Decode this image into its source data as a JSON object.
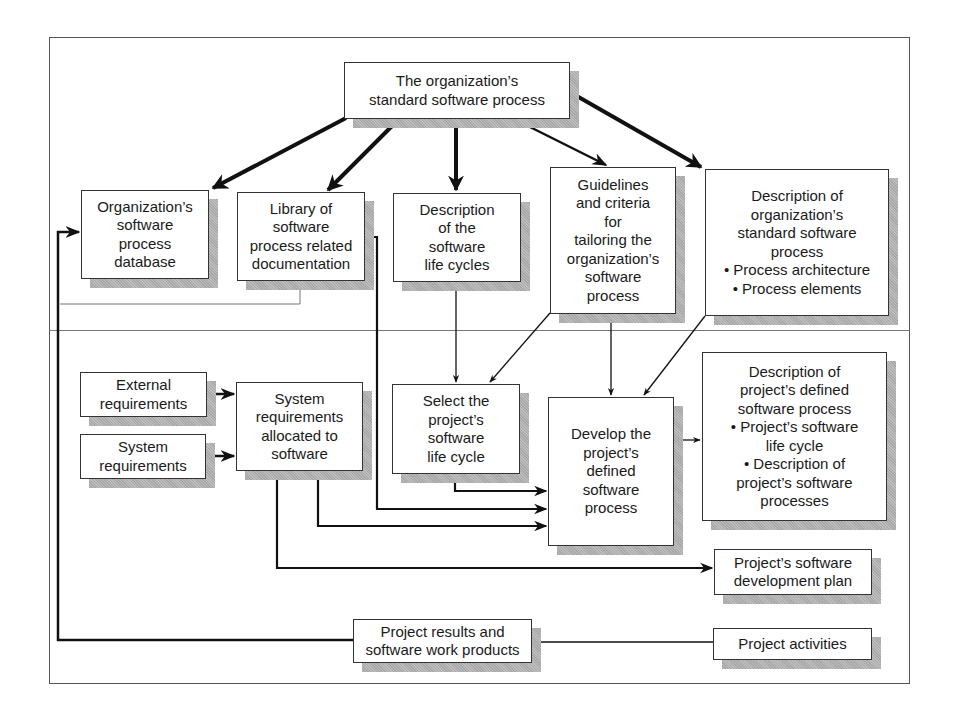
{
  "diagram": {
    "nodes": [
      {
        "id": "org_std_process",
        "label": "The organization’s\nstandard software process",
        "x": 344,
        "y": 62,
        "w": 226,
        "h": 57
      },
      {
        "id": "org_process_db",
        "label": "Organization’s\nsoftware\nprocess\ndatabase",
        "x": 81,
        "y": 190,
        "w": 128,
        "h": 89
      },
      {
        "id": "library_docs",
        "label": "Library of\nsoftware\nprocess related\ndocumentation",
        "x": 237,
        "y": 192,
        "w": 128,
        "h": 89
      },
      {
        "id": "desc_life_cycles",
        "label": "Description\nof the\nsoftware\nlife cycles",
        "x": 393,
        "y": 193,
        "w": 128,
        "h": 89
      },
      {
        "id": "tailoring_guidelines",
        "label": "Guidelines\nand criteria\nfor\ntailoring the\norganization’s\nsoftware\nprocess",
        "x": 550,
        "y": 167,
        "w": 126,
        "h": 147
      },
      {
        "id": "desc_org_std_process",
        "label": "Description of\norganization’s\nstandard software\nprocess\n• Process architecture\n• Process elements",
        "x": 705,
        "y": 169,
        "w": 184,
        "h": 147
      },
      {
        "id": "external_reqs",
        "label": "External\nrequirements",
        "x": 80,
        "y": 372,
        "w": 127,
        "h": 45
      },
      {
        "id": "system_reqs",
        "label": "System\nrequirements",
        "x": 80,
        "y": 434,
        "w": 126,
        "h": 45
      },
      {
        "id": "sys_reqs_alloc",
        "label": "System\nrequirements\nallocated to\nsoftware",
        "x": 236,
        "y": 382,
        "w": 127,
        "h": 89
      },
      {
        "id": "select_life_cycle",
        "label": "Select the\nproject’s\nsoftware\nlife cycle",
        "x": 392,
        "y": 384,
        "w": 128,
        "h": 90
      },
      {
        "id": "develop_defined_process",
        "label": "Develop the\nproject’s\ndefined\nsoftware\nprocess",
        "x": 548,
        "y": 397,
        "w": 126,
        "h": 149
      },
      {
        "id": "desc_project_process",
        "label": "Description of\nproject’s defined\nsoftware process\n• Project’s software\nlife cycle\n• Description of\nproject’s software\nprocesses",
        "x": 702,
        "y": 352,
        "w": 185,
        "h": 169
      },
      {
        "id": "dev_plan",
        "label": "Project’s software\ndevelopment plan",
        "x": 714,
        "y": 549,
        "w": 158,
        "h": 46
      },
      {
        "id": "results_products",
        "label": "Project results and\nsoftware work products",
        "x": 353,
        "y": 619,
        "w": 179,
        "h": 44
      },
      {
        "id": "project_activities",
        "label": "Project activities",
        "x": 713,
        "y": 628,
        "w": 159,
        "h": 32
      }
    ],
    "edges": [
      {
        "from": "org_std_process",
        "to": "org_process_db",
        "weight": "heavy"
      },
      {
        "from": "org_std_process",
        "to": "library_docs",
        "weight": "heavy"
      },
      {
        "from": "org_std_process",
        "to": "desc_life_cycles",
        "weight": "heavy"
      },
      {
        "from": "org_std_process",
        "to": "tailoring_guidelines",
        "weight": "medium"
      },
      {
        "from": "org_std_process",
        "to": "desc_org_std_process",
        "weight": "heavy"
      },
      {
        "from": "org_process_db",
        "to": "library_docs",
        "weight": "light"
      },
      {
        "from": "desc_life_cycles",
        "to": "select_life_cycle",
        "weight": "thin"
      },
      {
        "from": "tailoring_guidelines",
        "to": "select_life_cycle",
        "weight": "thin"
      },
      {
        "from": "tailoring_guidelines",
        "to": "develop_defined_process",
        "weight": "thin"
      },
      {
        "from": "desc_org_std_process",
        "to": "develop_defined_process",
        "weight": "thin"
      },
      {
        "from": "external_reqs",
        "to": "sys_reqs_alloc",
        "weight": "medium"
      },
      {
        "from": "system_reqs",
        "to": "sys_reqs_alloc",
        "weight": "medium"
      },
      {
        "from": "select_life_cycle",
        "to": "develop_defined_process",
        "weight": "medium"
      },
      {
        "from": "library_docs",
        "to": "develop_defined_process",
        "weight": "medium"
      },
      {
        "from": "sys_reqs_alloc",
        "to": "develop_defined_process",
        "weight": "medium"
      },
      {
        "from": "sys_reqs_alloc",
        "to": "dev_plan",
        "weight": "medium"
      },
      {
        "from": "develop_defined_process",
        "to": "desc_project_process",
        "weight": "thin"
      },
      {
        "from": "project_activities",
        "to": "results_products",
        "weight": "thin"
      },
      {
        "from": "results_products",
        "to": "org_process_db",
        "weight": "medium"
      }
    ]
  },
  "colors": {
    "line": "#111111",
    "border": "#333333",
    "shadow": "#b0b0b0",
    "frame": "#555555"
  }
}
